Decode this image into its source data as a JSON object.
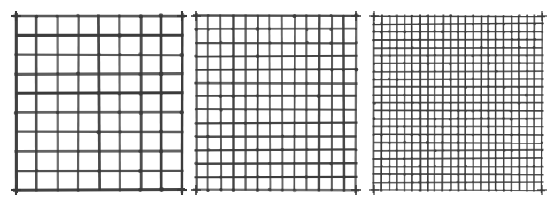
{
  "figure": {
    "title": "",
    "background_color": "#ffffff",
    "wire_color": "#3a3a3a",
    "panel_count": 3
  },
  "chart_data": {
    "type": "diagram",
    "title": "",
    "subtitle": "",
    "xlabel": "",
    "ylabel": "",
    "grid": true,
    "legend": "none",
    "panels": [
      {
        "id": "panel-coarse",
        "label": "",
        "columns": 8,
        "rows": 9,
        "x": 16,
        "y": 16,
        "width": 166,
        "height": 174,
        "wire_width_px": 2.6,
        "aperture_px": 19,
        "wire_color": "#3a3a3a"
      },
      {
        "id": "panel-medium",
        "label": "",
        "columns": 13,
        "rows": 13,
        "x": 196,
        "y": 16,
        "width": 160,
        "height": 174,
        "wire_width_px": 2.0,
        "aperture_px": 11.5,
        "wire_color": "#3a3a3a"
      },
      {
        "id": "panel-fine",
        "label": "",
        "columns": 22,
        "rows": 22,
        "x": 374,
        "y": 16,
        "width": 168,
        "height": 174,
        "wire_width_px": 1.5,
        "aperture_px": 7.2,
        "wire_color": "#3a3a3a"
      }
    ]
  }
}
